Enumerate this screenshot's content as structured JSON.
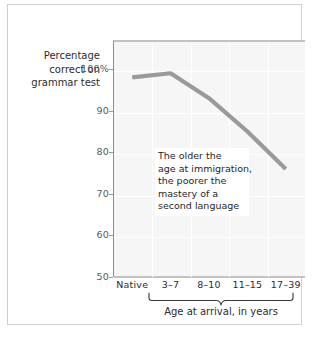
{
  "figure": {
    "y_axis_title_lines": [
      "Percentage",
      "correct on",
      "grammar test"
    ],
    "x_axis_caption": "Age at arrival, in years",
    "annotation_lines": [
      "The older the",
      "age at immigration,",
      "the poorer the",
      "mastery of a",
      "second language"
    ]
  },
  "colors": {
    "series_line": "#9a9a9a",
    "plot_background": "#f6f6f6",
    "gridline": "#ffffff",
    "axis": "#8d8d8d",
    "frame_border": "#cfcfcf",
    "text": "#2c2c2c",
    "tick_text": "#58585a"
  },
  "chart_data": {
    "type": "line",
    "title": "",
    "subtitle": "",
    "xlabel": "Age at arrival, in years",
    "ylabel": "Percentage correct on grammar test",
    "categories": [
      "Native",
      "3–7",
      "8–10",
      "11–15",
      "17–39"
    ],
    "values": [
      98,
      99,
      93,
      85,
      76
    ],
    "series": [
      {
        "name": "Percentage correct on grammar test",
        "values": [
          98,
          99,
          93,
          85,
          76
        ]
      }
    ],
    "ylim": [
      50,
      107
    ],
    "ytick_values": [
      50,
      60,
      70,
      80,
      90,
      100
    ],
    "ytick_labels": [
      "50",
      "60",
      "70",
      "80",
      "90",
      "100%"
    ],
    "xtick_labels": [
      "Native",
      "3–7",
      "8–10",
      "11–15",
      "17–39"
    ],
    "grid": true,
    "legend": "none",
    "annotations": [
      {
        "text": "The older the age at immigration, the poorer the mastery of a second language",
        "x_category": "8–10",
        "y_value": 78
      }
    ],
    "axis_group_brace": {
      "label": "Age at arrival, in years",
      "from_category": "3–7",
      "to_category": "17–39"
    }
  }
}
